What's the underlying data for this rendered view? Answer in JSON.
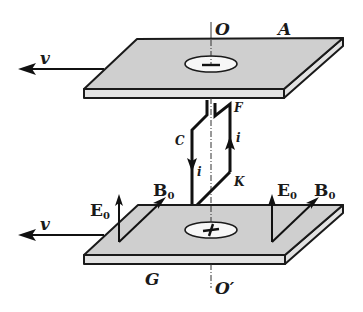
{
  "figure": {
    "labels": {
      "axis_top": "O",
      "axis_bottom": "O′",
      "top_plate": "A",
      "bottom_plate": "G",
      "velocity_top": "v",
      "velocity_bottom": "v",
      "loop_corner_C": "C",
      "loop_corner_D": "D",
      "loop_corner_K": "K",
      "loop_corner_F": "F",
      "current_left": "i",
      "current_right": "i",
      "field_E_left": "E",
      "field_E_left_sub": "0",
      "field_B_left": "B",
      "field_B_left_sub": "0",
      "field_E_right": "E",
      "field_E_right_sub": "0",
      "field_B_right": "B",
      "field_B_right_sub": "0"
    },
    "charges": {
      "top_plate_sign": "−",
      "bottom_plate_sign": "+"
    },
    "colors": {
      "plate_face": "#cfcfcf",
      "plate_edge": "#e2e2e2",
      "ink": "#111111"
    }
  }
}
